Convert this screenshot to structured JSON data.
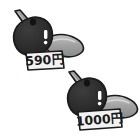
{
  "scene": {
    "title": "Two priced eggplant illustrations",
    "background_color": "#ffffff",
    "width": 140,
    "height": 138
  },
  "palette": {
    "outline": "#1b1b1b",
    "body_dark": "#2e2e2e",
    "body_shadow": "#1a1a1a",
    "pod_gray": "#9c9c9c",
    "pod_light": "#c9c9c9",
    "stem_gray": "#8f8f8f",
    "highlight": "#ffffff",
    "tag_face": "#f2f2f2",
    "tag_ink": "#1b1b1b"
  },
  "items": [
    {
      "id": "eggplant-top",
      "name": "eggplant-with-price-tag-top",
      "price_label": "590円",
      "price_value": 590,
      "currency_symbol": "円",
      "position": {
        "x": 8,
        "y": 8
      }
    },
    {
      "id": "eggplant-bottom",
      "name": "eggplant-with-price-tag-bottom",
      "price_label": "1000円",
      "price_value": 1000,
      "currency_symbol": "円",
      "position": {
        "x": 62,
        "y": 70
      }
    }
  ],
  "parts": {
    "stem_label": "stem",
    "body_label": "body",
    "pod_label": "curved-pod",
    "highlight_label": "gloss-highlight",
    "tag_label": "price-tag"
  }
}
